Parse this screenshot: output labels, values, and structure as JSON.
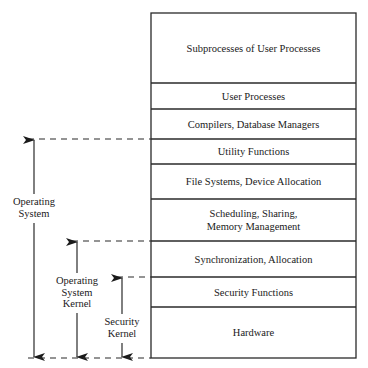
{
  "diagram": {
    "title": "",
    "colors": {
      "line": "#2a2a2a",
      "background": "#ffffff",
      "text": "#1a1a1a"
    },
    "stack": {
      "left": 151,
      "right": 356,
      "layers": [
        {
          "label": "Subprocesses of User Processes",
          "top": 13,
          "bottom": 83
        },
        {
          "label": "User Processes",
          "top": 83,
          "bottom": 109
        },
        {
          "label": "Compilers, Database Managers",
          "top": 109,
          "bottom": 139
        },
        {
          "label": "Utility Functions",
          "top": 139,
          "bottom": 164
        },
        {
          "label": "File Systems, Device Allocation",
          "top": 164,
          "bottom": 199
        },
        {
          "label": "Scheduling, Sharing,\nMemory Management",
          "top": 199,
          "bottom": 241
        },
        {
          "label": "Synchronization, Allocation",
          "top": 241,
          "bottom": 277
        },
        {
          "label": "Security Functions",
          "top": 277,
          "bottom": 307
        },
        {
          "label": "Hardware",
          "top": 307,
          "bottom": 358
        }
      ]
    },
    "brackets": [
      {
        "label": "Operating\nSystem",
        "x": 34,
        "top": 139,
        "bottom": 358,
        "label_top": 196,
        "label_bottom": 221,
        "dash_start_x": 28
      },
      {
        "label": "Operating\nSystem\nKernel",
        "x": 77,
        "top": 241,
        "bottom": 358,
        "label_top": 275,
        "label_bottom": 311,
        "dash_start_x": 72
      },
      {
        "label": "Security\nKernel",
        "x": 122,
        "top": 277,
        "bottom": 358,
        "label_top": 316,
        "label_bottom": 341,
        "dash_start_x": 117
      }
    ],
    "bottom_dash": {
      "y": 358,
      "from_x": 28,
      "to_x": 151
    }
  }
}
